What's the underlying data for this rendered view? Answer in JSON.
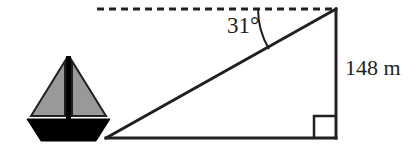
{
  "figure": {
    "type": "right-triangle-angle-of-depression-diagram",
    "labels": {
      "angle": "31°",
      "height": "148 m"
    },
    "colors": {
      "stroke": "#231f20",
      "sail_fill": "#999999",
      "hull_fill": "#000000",
      "background": "#ffffff"
    },
    "geometry": {
      "apex": {
        "x": 336,
        "y": 9
      },
      "bottom_right": {
        "x": 336,
        "y": 138
      },
      "bottom_left": {
        "x": 106,
        "y": 138
      },
      "dashed_line": {
        "x1": 97,
        "y1": 9,
        "x2": 336,
        "y2": 9
      },
      "right_angle_marker": {
        "x": 314,
        "y": 116,
        "size": 22
      },
      "angle_arc_radius": 78,
      "angle_degrees": 31,
      "stroke_width": 3
    },
    "boat": {
      "name": "sailboat-icon",
      "mast": {
        "x": 68,
        "top": 56,
        "bottom": 122,
        "width": 4
      },
      "left_sail": {
        "apex_x": 65,
        "apex_y": 61,
        "base_y": 116,
        "outer_x": 31
      },
      "right_sail": {
        "apex_x": 72,
        "apex_y": 61,
        "base_y": 116,
        "outer_x": 106
      },
      "hull": {
        "top_left_x": 27,
        "top_right_x": 110,
        "bottom_left_x": 41,
        "bottom_right_x": 96,
        "top_y": 119,
        "bottom_y": 141
      }
    }
  }
}
